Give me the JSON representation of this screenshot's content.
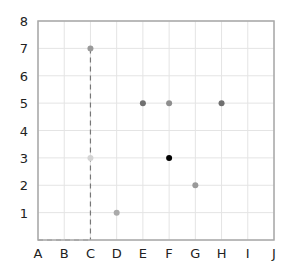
{
  "chart_data": {
    "type": "scatter",
    "title": "",
    "xlabel": "",
    "ylabel": "",
    "x_categories": [
      "A",
      "B",
      "C",
      "D",
      "E",
      "F",
      "G",
      "H",
      "I",
      "J"
    ],
    "y_ticks": [
      1,
      2,
      3,
      4,
      5,
      6,
      7,
      8
    ],
    "ylim": [
      0,
      8
    ],
    "grid": true,
    "legend": null,
    "points": [
      {
        "x": "C",
        "y": 7,
        "color": "#9a9a9a"
      },
      {
        "x": "C",
        "y": 3,
        "color": "#d4d4d4"
      },
      {
        "x": "D",
        "y": 1,
        "color": "#aaaaaa"
      },
      {
        "x": "E",
        "y": 5,
        "color": "#707070"
      },
      {
        "x": "F",
        "y": 5,
        "color": "#8e8e8e"
      },
      {
        "x": "H",
        "y": 5,
        "color": "#707070"
      },
      {
        "x": "F",
        "y": 3,
        "color": "#000000"
      },
      {
        "x": "G",
        "y": 2,
        "color": "#999999"
      }
    ],
    "dashed_lines": [
      {
        "from": {
          "x": "C",
          "y": 7
        },
        "to": {
          "x": "C",
          "y": 0
        }
      },
      {
        "from": {
          "x": "A",
          "y": 0
        },
        "to": {
          "x": "C",
          "y": 0
        }
      }
    ],
    "colors": {
      "grid": "#e4e4e4",
      "frame": "#a8a8a8",
      "dash": "#777777",
      "text": "#222222"
    }
  }
}
